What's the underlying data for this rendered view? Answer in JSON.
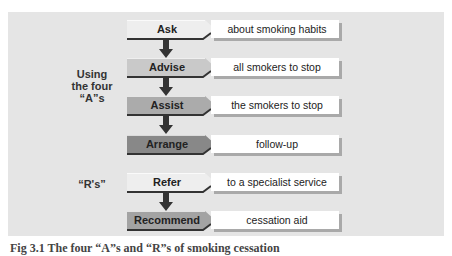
{
  "diagram": {
    "groups": [
      {
        "label_lines": [
          "Using",
          "the four",
          "“A”s"
        ]
      },
      {
        "label_lines": [
          "“R's”"
        ]
      }
    ],
    "steps": [
      {
        "action": "Ask",
        "detail": "about smoking habits",
        "fill": "#eeeeee",
        "group": "A"
      },
      {
        "action": "Advise",
        "detail": "all smokers to stop",
        "fill": "#c9c9c9",
        "group": "A"
      },
      {
        "action": "Assist",
        "detail": "the smokers to stop",
        "fill": "#ababab",
        "group": "A"
      },
      {
        "action": "Arrange",
        "detail": "follow-up",
        "fill": "#888888",
        "group": "A"
      },
      {
        "action": "Refer",
        "detail": "to a specialist service",
        "fill": "#eeeeee",
        "group": "R"
      },
      {
        "action": "Recommend",
        "detail": "cessation aid",
        "fill": "#a3a3a3",
        "group": "R"
      }
    ],
    "connections": [
      {
        "from": "Ask",
        "to": "Advise"
      },
      {
        "from": "Advise",
        "to": "Assist"
      },
      {
        "from": "Assist",
        "to": "Arrange"
      },
      {
        "from": "Refer",
        "to": "Recommend"
      }
    ],
    "colors": {
      "panel": "#e5e5e5",
      "arrow": "#333333",
      "underline": "#333333",
      "shadow": "#a9a9a9"
    },
    "caption": "Fig 3.1 The four “A”s and “R”s of smoking cessation"
  }
}
